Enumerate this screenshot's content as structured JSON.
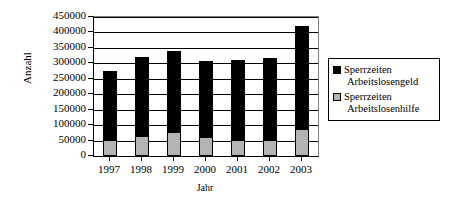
{
  "chart_data": {
    "type": "bar",
    "subtype": "stacked-vertical",
    "title": "",
    "xlabel": "Jahr",
    "ylabel": "Anzahl",
    "categories": [
      "1997",
      "1998",
      "1999",
      "2000",
      "2001",
      "2002",
      "2003"
    ],
    "series": [
      {
        "name": "Sperrzeiten Arbeitslosengeld",
        "color": "#000000",
        "values": [
          222000,
          253000,
          262000,
          247000,
          257000,
          265000,
          333000
        ]
      },
      {
        "name": "Sperrzeiten Arbeitslosenhilfe",
        "color": "#b3b3b3",
        "values": [
          52000,
          66000,
          78000,
          61000,
          53000,
          51000,
          89000
        ]
      }
    ],
    "totals": [
      274000,
      319000,
      340000,
      308000,
      310000,
      316000,
      422000
    ],
    "ylim": [
      0,
      450000
    ],
    "ytick_step": 50000,
    "yticks": [
      "450000",
      "400000",
      "350000",
      "300000",
      "250000",
      "200000",
      "150000",
      "100000",
      "50000",
      "0"
    ],
    "ytick_values": [
      450000,
      400000,
      350000,
      300000,
      250000,
      200000,
      150000,
      100000,
      50000,
      0
    ],
    "grid": "horizontal",
    "legend_position": "right"
  },
  "legend": {
    "entries": [
      {
        "line1": "Sperrzeiten",
        "line2": "Arbeitslosengeld",
        "swatch": "black"
      },
      {
        "line1": "Sperrzeiten",
        "line2": "Arbeitslosenhilfe",
        "swatch": "gray"
      }
    ]
  }
}
